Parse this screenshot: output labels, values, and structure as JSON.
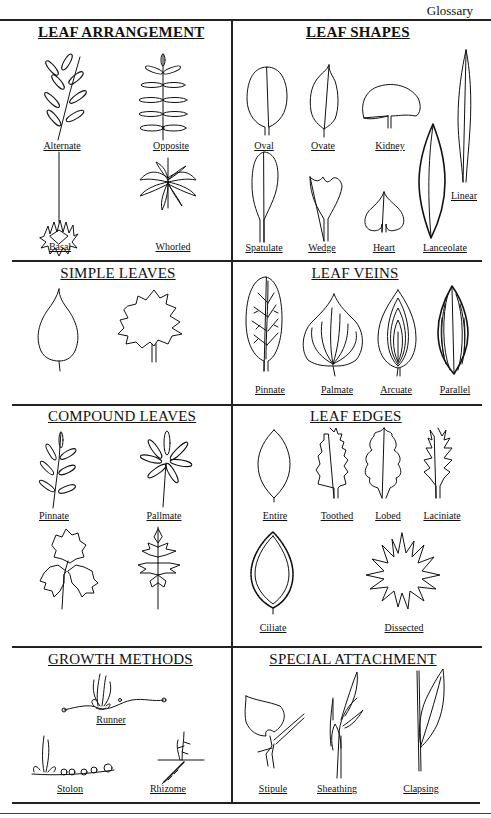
{
  "header": {
    "title": "Glossary"
  },
  "sections": {
    "leaf_arrangement": {
      "title": "LEAF ARRANGEMENT",
      "items": [
        "Alternate",
        "Opposite",
        "Basal",
        "Whorled"
      ]
    },
    "leaf_shapes": {
      "title": "LEAF SHAPES",
      "items": [
        "Oval",
        "Ovate",
        "Kidney",
        "Spatulate",
        "Wedge",
        "Heart",
        "Lanceolate",
        "Linear"
      ]
    },
    "simple_leaves": {
      "title": "SIMPLE LEAVES"
    },
    "leaf_veins": {
      "title": "LEAF VEINS",
      "items": [
        "Pinnate",
        "Palmate",
        "Arcuate",
        "Parallel"
      ]
    },
    "compound_leaves": {
      "title": "COMPOUND LEAVES",
      "items": [
        "Pinnate",
        "Pallmate"
      ]
    },
    "leaf_edges": {
      "title": "LEAF EDGES",
      "items": [
        "Entire",
        "Toothed",
        "Lobed",
        "Laciniate",
        "Ciliate",
        "Dissected"
      ]
    },
    "growth_methods": {
      "title": "GROWTH METHODS",
      "items": [
        "Runner",
        "Stolon",
        "Rhizome"
      ]
    },
    "special_attachment": {
      "title": "SPECIAL ATTACHMENT",
      "items": [
        "Stipule",
        "Sheathing",
        "Clapsing"
      ]
    }
  }
}
